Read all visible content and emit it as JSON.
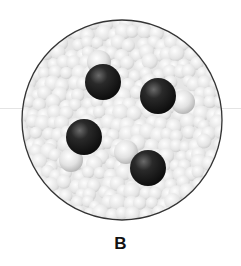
{
  "figure": {
    "label": "B",
    "circle": {
      "cx": 122,
      "cy": 120,
      "r": 100,
      "border_color": "#333333"
    },
    "background_particle_color": "#d9d9d9",
    "dark_atom_color": "#1e1e1e",
    "light_atom_color": "#cfcfcf",
    "molecules": [
      {
        "dark": {
          "x": 103,
          "y": 82,
          "r": 18
        },
        "light": {
          "x": 99,
          "y": 62,
          "r": 12
        }
      },
      {
        "dark": {
          "x": 158,
          "y": 96,
          "r": 18
        },
        "light": {
          "x": 183,
          "y": 102,
          "r": 12
        }
      },
      {
        "dark": {
          "x": 84,
          "y": 137,
          "r": 18
        },
        "light": {
          "x": 71,
          "y": 160,
          "r": 12
        }
      },
      {
        "dark": {
          "x": 148,
          "y": 168,
          "r": 18
        },
        "light": {
          "x": 126,
          "y": 152,
          "r": 12
        }
      }
    ]
  }
}
